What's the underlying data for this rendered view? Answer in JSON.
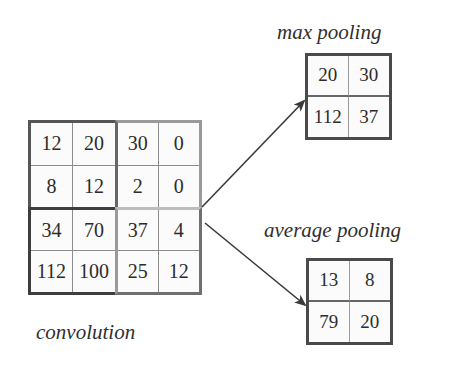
{
  "labels": {
    "max_pooling": "max pooling",
    "average_pooling": "average pooling",
    "convolution": "convolution"
  },
  "convolution_grid": {
    "rows": [
      [
        "12",
        "20",
        "30",
        "0"
      ],
      [
        "8",
        "12",
        "2",
        "0"
      ],
      [
        "34",
        "70",
        "37",
        "4"
      ],
      [
        "112",
        "100",
        "25",
        "12"
      ]
    ]
  },
  "max_pooling_grid": {
    "rows": [
      [
        "20",
        "30"
      ],
      [
        "112",
        "37"
      ]
    ]
  },
  "average_pooling_grid": {
    "rows": [
      [
        "13",
        "8"
      ],
      [
        "79",
        "20"
      ]
    ]
  },
  "colors": {
    "dark_border": "#555555",
    "light_border": "#9a9a9a",
    "arrow": "#3a3a3a"
  }
}
